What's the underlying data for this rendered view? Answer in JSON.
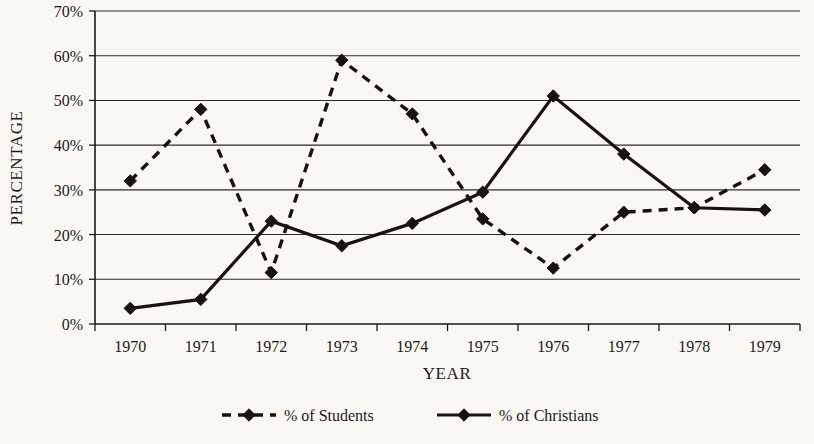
{
  "chart_data": {
    "type": "line",
    "title": "",
    "xlabel": "YEAR",
    "ylabel": "PERCENTAGE",
    "categories": [
      "1970",
      "1971",
      "1972",
      "1973",
      "1974",
      "1975",
      "1976",
      "1977",
      "1978",
      "1979"
    ],
    "x": [
      1970,
      1971,
      1972,
      1973,
      1974,
      1975,
      1976,
      1977,
      1978,
      1979
    ],
    "ylim": [
      0,
      70
    ],
    "ytick_values": [
      0,
      10,
      20,
      30,
      40,
      50,
      60,
      70
    ],
    "ytick_labels": [
      "0%",
      "10%",
      "20%",
      "30%",
      "40%",
      "50%",
      "60%",
      "70%"
    ],
    "grid": "horizontal",
    "legend_position": "bottom",
    "series": [
      {
        "name": "% of Students",
        "style": "dashed",
        "marker": "diamond",
        "color": "#17130f",
        "values": [
          32,
          48,
          11.5,
          59,
          47,
          23.5,
          12.5,
          25,
          26,
          34.5
        ]
      },
      {
        "name": "% of Christians",
        "style": "solid",
        "marker": "diamond",
        "color": "#17130f",
        "values": [
          3.5,
          5.5,
          23,
          17.5,
          22.5,
          29.5,
          51,
          38,
          26,
          25.5
        ]
      }
    ]
  },
  "legend": {
    "items": [
      {
        "label": "% of Students",
        "style": "dashed"
      },
      {
        "label": "% of Christians",
        "style": "solid"
      }
    ]
  },
  "axes": {
    "y_title": "PERCENTAGE",
    "x_title": "YEAR"
  }
}
